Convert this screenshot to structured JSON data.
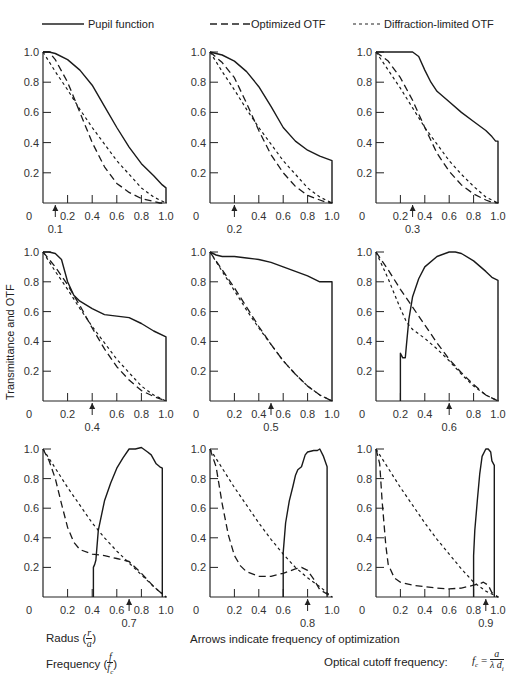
{
  "legend": {
    "pupil": "Pupil function",
    "optimized": "Optimized OTF",
    "diffraction": "Diffraction-limited OTF"
  },
  "ylabel": "Transmittance and OTF",
  "notes": {
    "radus_label": "Radus (",
    "radius_num": "r",
    "radius_den": "a",
    "freq_label": "Frequency (",
    "freq_num": "f",
    "freq_den": "f",
    "freq_den_sub": "c",
    "close_paren": ")",
    "arrows": "Arrows indicate frequency of optimization",
    "cutoff": "Optical  cutoff frequency:",
    "formula_lhs": "f",
    "formula_lhs_sub": "c",
    "formula_eq": " = ",
    "formula_num": "a",
    "formula_den": "λ d",
    "formula_den_sub": "i"
  },
  "chart_data": [
    {
      "type": "line",
      "title": "",
      "opt_freq": 0.1,
      "xlim": [
        0,
        1
      ],
      "ylim": [
        0,
        1
      ],
      "xticks": [
        "0",
        "0.2",
        "0.4",
        "0.6",
        "0.8",
        "1.0"
      ],
      "yticks": [
        "0.2",
        "0.4",
        "0.6",
        "0.8",
        "1.0"
      ],
      "series": [
        {
          "name": "Pupil function",
          "x": [
            0,
            0.05,
            0.1,
            0.2,
            0.3,
            0.4,
            0.5,
            0.6,
            0.7,
            0.8,
            0.9,
            0.97,
            1.0,
            1.0
          ],
          "y": [
            1,
            1,
            0.99,
            0.95,
            0.88,
            0.78,
            0.64,
            0.5,
            0.37,
            0.26,
            0.18,
            0.12,
            0.1,
            0
          ]
        },
        {
          "name": "Optimized OTF",
          "x": [
            0,
            0.05,
            0.1,
            0.2,
            0.3,
            0.4,
            0.5,
            0.6,
            0.7,
            0.8,
            0.9,
            0.95,
            1.0
          ],
          "y": [
            1,
            1,
            0.95,
            0.8,
            0.6,
            0.4,
            0.24,
            0.13,
            0.07,
            0.03,
            0.01,
            0,
            0
          ]
        },
        {
          "name": "Diffraction-limited OTF",
          "x": [
            0,
            0.1,
            0.2,
            0.3,
            0.4,
            0.5,
            0.6,
            0.7,
            0.8,
            0.9,
            1.0
          ],
          "y": [
            1,
            0.87,
            0.75,
            0.62,
            0.5,
            0.39,
            0.28,
            0.19,
            0.1,
            0.04,
            0
          ]
        }
      ]
    },
    {
      "type": "line",
      "title": "",
      "opt_freq": 0.2,
      "xlim": [
        0,
        1
      ],
      "ylim": [
        0,
        1
      ],
      "xticks": [
        "0",
        "",
        "0.4",
        "0.6",
        "0.8",
        "1.0"
      ],
      "yticks": [
        "0.2",
        "0.4",
        "0.6",
        "0.8",
        "1.0"
      ],
      "series": [
        {
          "name": "Pupil function",
          "x": [
            0,
            0.1,
            0.2,
            0.3,
            0.4,
            0.5,
            0.6,
            0.7,
            0.8,
            0.9,
            1.0,
            1.0
          ],
          "y": [
            1,
            0.98,
            0.94,
            0.87,
            0.77,
            0.64,
            0.5,
            0.41,
            0.35,
            0.31,
            0.28,
            0
          ]
        },
        {
          "name": "Optimized OTF",
          "x": [
            0,
            0.1,
            0.2,
            0.3,
            0.4,
            0.5,
            0.6,
            0.7,
            0.8,
            0.9,
            0.95,
            1.0
          ],
          "y": [
            1,
            0.93,
            0.83,
            0.66,
            0.48,
            0.32,
            0.2,
            0.11,
            0.05,
            0.02,
            0.005,
            0
          ]
        },
        {
          "name": "Diffraction-limited OTF",
          "x": [
            0,
            0.1,
            0.2,
            0.3,
            0.4,
            0.5,
            0.6,
            0.7,
            0.8,
            0.9,
            1.0
          ],
          "y": [
            1,
            0.87,
            0.75,
            0.62,
            0.5,
            0.39,
            0.28,
            0.19,
            0.1,
            0.04,
            0
          ]
        }
      ]
    },
    {
      "type": "line",
      "title": "",
      "opt_freq": 0.3,
      "xlim": [
        0,
        1
      ],
      "ylim": [
        0,
        1
      ],
      "xticks": [
        "0",
        "0.2",
        "0.4",
        "0.6",
        "0.8",
        "1.0"
      ],
      "yticks": [
        "0.2",
        "0.4",
        "0.6",
        "0.8",
        "1.0"
      ],
      "series": [
        {
          "name": "Pupil function",
          "x": [
            0,
            0.1,
            0.2,
            0.3,
            0.35,
            0.4,
            0.45,
            0.5,
            0.6,
            0.7,
            0.8,
            0.9,
            0.95,
            0.98,
            1.0,
            1.0
          ],
          "y": [
            1,
            1,
            1,
            1,
            0.97,
            0.88,
            0.8,
            0.74,
            0.67,
            0.6,
            0.54,
            0.48,
            0.44,
            0.41,
            0.41,
            0
          ]
        },
        {
          "name": "Optimized OTF",
          "x": [
            0,
            0.1,
            0.2,
            0.3,
            0.4,
            0.5,
            0.6,
            0.7,
            0.8,
            0.9,
            0.95,
            1.0
          ],
          "y": [
            1,
            0.94,
            0.83,
            0.68,
            0.5,
            0.33,
            0.21,
            0.12,
            0.06,
            0.02,
            0.005,
            0
          ]
        },
        {
          "name": "Diffraction-limited OTF",
          "x": [
            0,
            0.1,
            0.2,
            0.3,
            0.4,
            0.5,
            0.6,
            0.7,
            0.8,
            0.9,
            1.0
          ],
          "y": [
            1,
            0.88,
            0.76,
            0.63,
            0.5,
            0.39,
            0.28,
            0.19,
            0.11,
            0.04,
            0
          ]
        }
      ]
    },
    {
      "type": "line",
      "title": "",
      "opt_freq": 0.4,
      "xlim": [
        0,
        1
      ],
      "ylim": [
        0,
        1
      ],
      "xticks": [
        "0",
        "0.2",
        "",
        "0.6",
        "0.8",
        "1.0"
      ],
      "yticks": [
        "0.2",
        "0.4",
        "0.6",
        "0.8",
        "1.0"
      ],
      "series": [
        {
          "name": "Pupil function",
          "x": [
            0,
            0.05,
            0.1,
            0.15,
            0.2,
            0.25,
            0.3,
            0.4,
            0.5,
            0.6,
            0.7,
            0.8,
            0.9,
            1.0,
            1.0
          ],
          "y": [
            1,
            1,
            0.99,
            0.95,
            0.8,
            0.71,
            0.67,
            0.62,
            0.58,
            0.57,
            0.56,
            0.52,
            0.47,
            0.43,
            0
          ]
        },
        {
          "name": "Optimized OTF",
          "x": [
            0,
            0.1,
            0.2,
            0.3,
            0.4,
            0.5,
            0.6,
            0.7,
            0.8,
            0.9,
            1.0
          ],
          "y": [
            1,
            0.9,
            0.78,
            0.64,
            0.49,
            0.35,
            0.23,
            0.14,
            0.07,
            0.03,
            0
          ]
        },
        {
          "name": "Diffraction-limited OTF",
          "x": [
            0,
            0.1,
            0.2,
            0.3,
            0.4,
            0.5,
            0.6,
            0.7,
            0.8,
            0.9,
            1.0
          ],
          "y": [
            1,
            0.87,
            0.75,
            0.62,
            0.5,
            0.39,
            0.28,
            0.19,
            0.1,
            0.04,
            0
          ]
        }
      ]
    },
    {
      "type": "line",
      "title": "",
      "opt_freq": 0.5,
      "xlim": [
        0,
        1
      ],
      "ylim": [
        0,
        1
      ],
      "xticks": [
        "0",
        "0.2",
        "0.4",
        "0.6",
        "0.8",
        "1.0"
      ],
      "yticks": [
        "0.2",
        "0.4",
        "0.6",
        "0.8",
        "1.0"
      ],
      "series": [
        {
          "name": "Pupil function",
          "x": [
            0,
            0.05,
            0.1,
            0.2,
            0.3,
            0.4,
            0.5,
            0.6,
            0.7,
            0.8,
            0.9,
            1.0,
            1.0
          ],
          "y": [
            1,
            0.98,
            0.97,
            0.97,
            0.96,
            0.95,
            0.93,
            0.9,
            0.87,
            0.84,
            0.8,
            0.8,
            0
          ]
        },
        {
          "name": "Optimized OTF",
          "x": [
            0,
            0.1,
            0.2,
            0.3,
            0.4,
            0.5,
            0.6,
            0.7,
            0.8,
            0.9,
            1.0
          ],
          "y": [
            1,
            0.88,
            0.76,
            0.63,
            0.5,
            0.38,
            0.27,
            0.18,
            0.1,
            0.04,
            0
          ]
        },
        {
          "name": "Diffraction-limited OTF",
          "x": [
            0,
            0.1,
            0.2,
            0.3,
            0.4,
            0.5,
            0.6,
            0.7,
            0.8,
            0.9,
            1.0
          ],
          "y": [
            1,
            0.87,
            0.74,
            0.61,
            0.49,
            0.38,
            0.27,
            0.18,
            0.1,
            0.04,
            0
          ]
        }
      ]
    },
    {
      "type": "line",
      "title": "",
      "opt_freq": 0.6,
      "xlim": [
        0,
        1
      ],
      "ylim": [
        0,
        1
      ],
      "xticks": [
        "0",
        "0.2",
        "0.4",
        "",
        "0.8",
        "1.0"
      ],
      "yticks": [
        "0.2",
        "0.4",
        "0.6",
        "0.8",
        "1.0"
      ],
      "series": [
        {
          "name": "Pupil function",
          "x": [
            0.2,
            0.2,
            0.22,
            0.24,
            0.25,
            0.27,
            0.3,
            0.35,
            0.4,
            0.5,
            0.6,
            0.65,
            0.7,
            0.8,
            0.9,
            0.95,
            1.0,
            1.0
          ],
          "y": [
            0,
            0.32,
            0.29,
            0.29,
            0.38,
            0.55,
            0.7,
            0.82,
            0.9,
            0.97,
            1,
            1,
            0.99,
            0.94,
            0.87,
            0.83,
            0.81,
            0
          ]
        },
        {
          "name": "Optimized OTF",
          "x": [
            0,
            0.1,
            0.2,
            0.3,
            0.4,
            0.5,
            0.6,
            0.7,
            0.8,
            0.9,
            1.0
          ],
          "y": [
            1,
            0.88,
            0.75,
            0.63,
            0.51,
            0.39,
            0.28,
            0.19,
            0.11,
            0.04,
            0
          ]
        },
        {
          "name": "Diffraction-limited OTF",
          "x": [
            0,
            0.1,
            0.2,
            0.25,
            0.3,
            0.4,
            0.5,
            0.6,
            0.7,
            0.8,
            0.9,
            1.0
          ],
          "y": [
            1,
            0.82,
            0.62,
            0.53,
            0.48,
            0.42,
            0.35,
            0.27,
            0.18,
            0.1,
            0.04,
            0
          ]
        }
      ]
    },
    {
      "type": "line",
      "title": "",
      "opt_freq": 0.7,
      "xlim": [
        0,
        1
      ],
      "ylim": [
        0,
        1
      ],
      "xticks": [
        "0",
        "0.2",
        "0.4",
        "0.6",
        "0.8",
        "1.0"
      ],
      "yticks": [
        "0.2",
        "0.4",
        "0.6",
        "0.8",
        "1.0"
      ],
      "series": [
        {
          "name": "Pupil function",
          "x": [
            0.41,
            0.41,
            0.42,
            0.43,
            0.45,
            0.5,
            0.55,
            0.6,
            0.65,
            0.7,
            0.75,
            0.8,
            0.85,
            0.88,
            0.92,
            0.95,
            0.97,
            0.97
          ],
          "y": [
            0,
            0.2,
            0.22,
            0.25,
            0.45,
            0.65,
            0.77,
            0.87,
            0.94,
            1,
            1,
            1.01,
            0.98,
            0.96,
            0.9,
            0.88,
            0.87,
            0
          ]
        },
        {
          "name": "Optimized OTF",
          "x": [
            0,
            0.05,
            0.1,
            0.15,
            0.2,
            0.25,
            0.3,
            0.4,
            0.5,
            0.6,
            0.7,
            0.8,
            0.9,
            1.0
          ],
          "y": [
            1,
            0.92,
            0.8,
            0.63,
            0.47,
            0.37,
            0.32,
            0.29,
            0.28,
            0.26,
            0.24,
            0.16,
            0.07,
            0
          ]
        },
        {
          "name": "Diffraction-limited OTF",
          "x": [
            0,
            0.1,
            0.2,
            0.3,
            0.4,
            0.5,
            0.6,
            0.7,
            0.8,
            0.9,
            1.0
          ],
          "y": [
            1,
            0.87,
            0.74,
            0.62,
            0.5,
            0.4,
            0.31,
            0.23,
            0.15,
            0.07,
            0
          ]
        }
      ]
    },
    {
      "type": "line",
      "title": "",
      "opt_freq": 0.8,
      "xlim": [
        0,
        1
      ],
      "ylim": [
        0,
        1
      ],
      "xticks": [
        "0",
        "0.2",
        "0.4",
        "0.6",
        "",
        "1.0"
      ],
      "yticks": [
        "0.2",
        "0.4",
        "0.6",
        "0.8",
        "1.0"
      ],
      "series": [
        {
          "name": "Pupil function",
          "x": [
            0.6,
            0.6,
            0.62,
            0.65,
            0.68,
            0.7,
            0.72,
            0.75,
            0.78,
            0.8,
            0.85,
            0.88,
            0.9,
            0.93,
            0.96,
            0.96
          ],
          "y": [
            0,
            0.3,
            0.5,
            0.65,
            0.75,
            0.82,
            0.86,
            0.88,
            0.96,
            0.98,
            0.99,
            0.99,
            1,
            0.95,
            0.88,
            0
          ]
        },
        {
          "name": "Optimized OTF",
          "x": [
            0,
            0.05,
            0.1,
            0.15,
            0.2,
            0.25,
            0.3,
            0.4,
            0.5,
            0.6,
            0.7,
            0.75,
            0.8,
            0.85,
            0.9,
            1.0
          ],
          "y": [
            1,
            0.88,
            0.63,
            0.42,
            0.28,
            0.21,
            0.17,
            0.14,
            0.14,
            0.16,
            0.19,
            0.2,
            0.18,
            0.12,
            0.05,
            0
          ]
        },
        {
          "name": "Diffraction-limited OTF",
          "x": [
            0,
            0.1,
            0.2,
            0.3,
            0.4,
            0.5,
            0.6,
            0.7,
            0.8,
            0.9,
            1.0
          ],
          "y": [
            1,
            0.87,
            0.74,
            0.62,
            0.5,
            0.39,
            0.29,
            0.2,
            0.13,
            0.07,
            0
          ]
        }
      ]
    },
    {
      "type": "line",
      "title": "",
      "opt_freq": 0.9,
      "xlim": [
        0,
        1
      ],
      "ylim": [
        0,
        1
      ],
      "xticks": [
        "0",
        "0.2",
        "0.4",
        "0.6",
        "0.8",
        "1.0"
      ],
      "yticks": [
        "0.2",
        "0.4",
        "0.6",
        "0.8",
        "1.0"
      ],
      "series": [
        {
          "name": "Pupil function",
          "x": [
            0.8,
            0.8,
            0.81,
            0.83,
            0.85,
            0.87,
            0.9,
            0.92,
            0.94,
            0.95,
            0.97,
            0.97
          ],
          "y": [
            0,
            0.28,
            0.45,
            0.65,
            0.83,
            0.95,
            1,
            1,
            0.98,
            0.92,
            0.89,
            0
          ]
        },
        {
          "name": "Optimized OTF",
          "x": [
            0,
            0.03,
            0.05,
            0.08,
            0.1,
            0.15,
            0.2,
            0.3,
            0.4,
            0.5,
            0.6,
            0.7,
            0.8,
            0.85,
            0.88,
            0.92,
            0.95,
            1.0
          ],
          "y": [
            1,
            0.9,
            0.65,
            0.35,
            0.22,
            0.13,
            0.1,
            0.08,
            0.07,
            0.06,
            0.055,
            0.06,
            0.08,
            0.09,
            0.1,
            0.08,
            0.03,
            0
          ]
        },
        {
          "name": "Diffraction-limited OTF",
          "x": [
            0,
            0.1,
            0.2,
            0.3,
            0.4,
            0.5,
            0.6,
            0.7,
            0.8,
            0.9,
            1.0
          ],
          "y": [
            1,
            0.87,
            0.74,
            0.62,
            0.5,
            0.39,
            0.29,
            0.19,
            0.1,
            0.04,
            0
          ]
        }
      ]
    }
  ]
}
